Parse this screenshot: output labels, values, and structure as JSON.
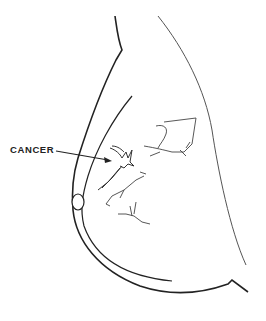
{
  "figure": {
    "annotation": {
      "label": "CANCER",
      "target": "spiculated mass in upper inner region"
    },
    "colors": {
      "line": "#222222",
      "thin_line": "#555555",
      "background": "#ffffff"
    }
  }
}
